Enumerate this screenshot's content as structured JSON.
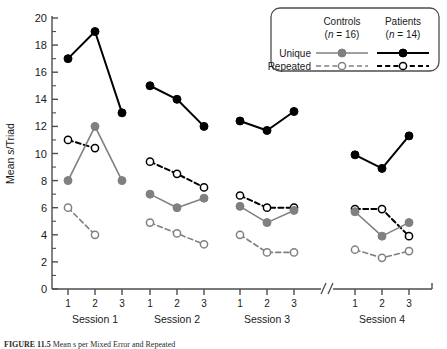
{
  "figure": {
    "caption_prefix": "FIGURE 11.5",
    "caption_rest": "Mean s per Mixed Error and Repeated"
  },
  "axes": {
    "ylabel_pre": "Mean ",
    "ylabel_ital": "s",
    "ylabel_post": "/Triad",
    "yticks": [
      "0",
      "2",
      "4",
      "6",
      "8",
      "10",
      "12",
      "14",
      "16",
      "18",
      "20"
    ],
    "ylim": [
      0,
      20
    ],
    "xtick_labels": [
      "1",
      "2",
      "3"
    ],
    "session_labels": [
      "Session 1",
      "Session 2",
      "Session 3",
      "Session 4"
    ],
    "axis_break_between": "Session 3 and Session 4"
  },
  "legend": {
    "col_headers": [
      {
        "name": "Controls",
        "n": "(n = 16)",
        "n_pre": "(",
        "n_ital": "n",
        "n_post": " = 16)"
      },
      {
        "name": "Patients",
        "n": "(n = 14)",
        "n_pre": "(",
        "n_ital": "n",
        "n_post": " = 14)"
      }
    ],
    "row_labels": [
      "Unique",
      "Repeated"
    ]
  },
  "colors": {
    "controls": "#808080",
    "patients": "#000000",
    "axis": "#4d4d4d",
    "background": "#ffffff",
    "legend_border": "#4d4d4d"
  },
  "chart_data": {
    "type": "line",
    "title": "",
    "xlabel": "",
    "ylabel": "Mean s/Triad",
    "ylim": [
      0,
      20
    ],
    "ytick_interval": 2,
    "grid": false,
    "legend_position": "top-right",
    "x_groups": [
      {
        "group": "Session 1",
        "x": [
          1,
          2,
          3
        ]
      },
      {
        "group": "Session 2",
        "x": [
          1,
          2,
          3
        ]
      },
      {
        "group": "Session 3",
        "x": [
          1,
          2,
          3
        ]
      },
      {
        "group": "Session 4",
        "x": [
          1,
          2,
          3
        ]
      }
    ],
    "series": [
      {
        "name": "Patients Unique",
        "group_label": "Patients",
        "condition": "Unique",
        "color": "#000000",
        "line": "solid",
        "marker": "filled-circle",
        "segments": [
          {
            "group": "Session 1",
            "x": [
              1,
              2,
              3
            ],
            "values": [
              17.0,
              19.0,
              13.0
            ]
          },
          {
            "group": "Session 2",
            "x": [
              1,
              2,
              3
            ],
            "values": [
              15.0,
              14.0,
              12.0
            ]
          },
          {
            "group": "Session 3",
            "x": [
              1,
              2,
              3
            ],
            "values": [
              12.4,
              11.7,
              13.1
            ]
          },
          {
            "group": "Session 4",
            "x": [
              1,
              2,
              3
            ],
            "values": [
              9.9,
              8.9,
              11.3
            ]
          }
        ]
      },
      {
        "name": "Patients Repeated",
        "group_label": "Patients",
        "condition": "Repeated",
        "color": "#000000",
        "line": "dashed",
        "marker": "open-circle",
        "segments": [
          {
            "group": "Session 1",
            "x": [
              1,
              2
            ],
            "values": [
              11.0,
              10.4
            ]
          },
          {
            "group": "Session 2",
            "x": [
              1,
              2,
              3
            ],
            "values": [
              9.4,
              8.5,
              7.5
            ]
          },
          {
            "group": "Session 3",
            "x": [
              1,
              2,
              3
            ],
            "values": [
              6.9,
              6.0,
              6.0
            ]
          },
          {
            "group": "Session 4",
            "x": [
              1,
              2,
              3
            ],
            "values": [
              5.9,
              5.9,
              3.9
            ]
          }
        ]
      },
      {
        "name": "Controls Unique",
        "group_label": "Controls",
        "condition": "Unique",
        "color": "#808080",
        "line": "solid",
        "marker": "filled-circle",
        "segments": [
          {
            "group": "Session 1",
            "x": [
              1,
              2,
              3
            ],
            "values": [
              8.0,
              12.0,
              8.0
            ]
          },
          {
            "group": "Session 2",
            "x": [
              1,
              2,
              3
            ],
            "values": [
              7.0,
              6.0,
              6.7
            ]
          },
          {
            "group": "Session 3",
            "x": [
              1,
              2,
              3
            ],
            "values": [
              6.1,
              4.9,
              5.8
            ]
          },
          {
            "group": "Session 4",
            "x": [
              1,
              2,
              3
            ],
            "values": [
              5.7,
              3.9,
              4.9
            ]
          }
        ]
      },
      {
        "name": "Controls Repeated",
        "group_label": "Controls",
        "condition": "Repeated",
        "color": "#808080",
        "line": "dashed",
        "marker": "open-circle",
        "segments": [
          {
            "group": "Session 1",
            "x": [
              1,
              2
            ],
            "values": [
              6.0,
              4.0
            ]
          },
          {
            "group": "Session 2",
            "x": [
              1,
              2,
              3
            ],
            "values": [
              4.9,
              4.1,
              3.3
            ]
          },
          {
            "group": "Session 3",
            "x": [
              1,
              2,
              3
            ],
            "values": [
              4.0,
              2.7,
              2.7
            ]
          },
          {
            "group": "Session 4",
            "x": [
              1,
              2,
              3
            ],
            "values": [
              2.9,
              2.3,
              2.8
            ]
          }
        ]
      }
    ]
  }
}
